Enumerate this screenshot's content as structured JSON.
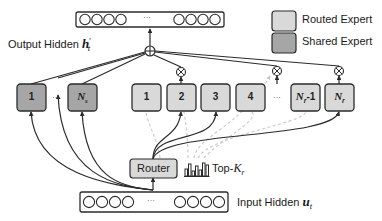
{
  "legend": {
    "items": [
      {
        "label": "Routed Expert",
        "color": "#d9d9d9"
      },
      {
        "label": "Shared Expert",
        "color": "#a6a6a6"
      }
    ]
  },
  "output": {
    "label": "Output Hidden ",
    "symbol": "h",
    "superscript": "′",
    "subscript": "t",
    "ellipsis": "···"
  },
  "input": {
    "label": "Input Hidden ",
    "symbol": "u",
    "subscript": "t",
    "ellipsis": "···"
  },
  "shared_experts": [
    {
      "label": "1"
    },
    {
      "label": "N",
      "sub": "s"
    }
  ],
  "shared_ellipsis": "···",
  "routed_experts": [
    {
      "label": "1"
    },
    {
      "label": "2"
    },
    {
      "label": "3"
    },
    {
      "label": "4"
    },
    {
      "label": "N",
      "sub": "r",
      "suffix": "-1"
    },
    {
      "label": "N",
      "sub": "r"
    }
  ],
  "routed_ellipsis": "···",
  "router": {
    "label": "Router"
  },
  "topk": {
    "label": "Top-",
    "symbol": "K",
    "sub": "r"
  },
  "colors": {
    "routed": "#d9d9d9",
    "shared": "#a6a6a6",
    "stroke": "#2b2b2b",
    "dashed": "#c8c8c8"
  }
}
